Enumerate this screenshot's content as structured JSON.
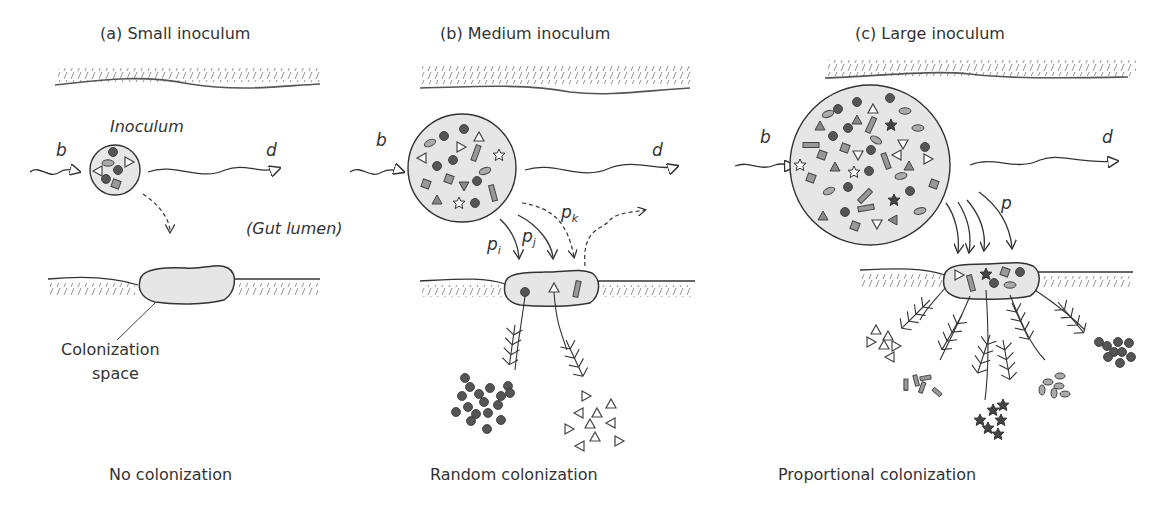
{
  "panels": [
    {
      "title": "(a) Small inoculum",
      "inoculum_label": "Inoculum",
      "birth_symbol": "b",
      "death_symbol": "d",
      "lumen_label": "(Gut lumen)",
      "space_label_line1": "Colonization",
      "space_label_line2": "space",
      "outcome": "No colonization"
    },
    {
      "title": "(b) Medium inoculum",
      "birth_symbol": "b",
      "death_symbol": "d",
      "prob_i": "p",
      "prob_i_sub": "i",
      "prob_j": "p",
      "prob_j_sub": "j",
      "prob_k": "p",
      "prob_k_sub": "k",
      "outcome": "Random colonization"
    },
    {
      "title": "(c) Large inoculum",
      "birth_symbol": "b",
      "death_symbol": "d",
      "prob": "p",
      "outcome": "Proportional colonization"
    }
  ],
  "colors": {
    "ink": "#333333",
    "fill_gray": "#e6e6e6",
    "dot_dark": "#555555",
    "shape_mid": "#888888"
  }
}
